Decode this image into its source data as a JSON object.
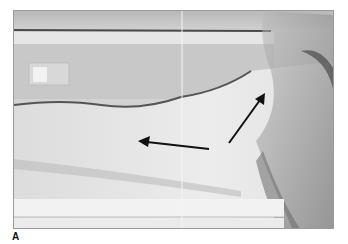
{
  "figure": {
    "panel_label": "A",
    "image_description": "Grayscale clinical photograph of a limb on a surface with two arrows indicating regions of interest",
    "arrows": [
      {
        "name": "left-arrow",
        "from": [
          208,
          148
        ],
        "to": [
          137,
          140
        ]
      },
      {
        "name": "upper-right-arrow",
        "from": [
          228,
          142
        ],
        "to": [
          264,
          92
        ]
      }
    ],
    "colors": {
      "background": "#ffffff",
      "arrow": "#111111"
    }
  }
}
